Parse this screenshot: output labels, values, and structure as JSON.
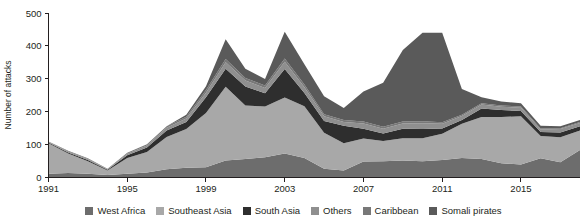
{
  "chart_data": {
    "type": "area",
    "stacked": true,
    "title": "",
    "xlabel": "",
    "ylabel": "Number of attacks",
    "ylim": [
      0,
      500
    ],
    "ytick_step": 100,
    "yticks": [
      0,
      100,
      200,
      300,
      400,
      500
    ],
    "ytick_labels": [
      "0",
      "100",
      "200",
      "300",
      "400",
      "500"
    ],
    "xlim": [
      1991,
      2018
    ],
    "xticks": [
      1991,
      1995,
      1999,
      2003,
      2007,
      2011,
      2015
    ],
    "xtick_labels": [
      "1991",
      "1995",
      "1999",
      "2003",
      "2007",
      "2011",
      "2015"
    ],
    "grid": false,
    "legend_position": "bottom",
    "x": [
      1991,
      1992,
      1993,
      1994,
      1995,
      1996,
      1997,
      1998,
      1999,
      2000,
      2001,
      2002,
      2003,
      2004,
      2005,
      2006,
      2007,
      2008,
      2009,
      2010,
      2011,
      2012,
      2013,
      2014,
      2015,
      2016,
      2017,
      2018
    ],
    "series": [
      {
        "name": "West Africa",
        "color": "#6d6d6d",
        "values": [
          10,
          12,
          10,
          6,
          10,
          14,
          24,
          28,
          30,
          50,
          55,
          60,
          72,
          58,
          25,
          20,
          47,
          48,
          50,
          48,
          52,
          58,
          55,
          42,
          38,
          57,
          45,
          82
        ]
      },
      {
        "name": "Southeast Asia",
        "color": "#a8a8a8",
        "values": [
          93,
          60,
          38,
          14,
          48,
          62,
          98,
          118,
          165,
          225,
          163,
          155,
          170,
          158,
          110,
          83,
          70,
          62,
          68,
          70,
          80,
          104,
          128,
          141,
          147,
          68,
          76,
          60
        ]
      },
      {
        "name": "South Asia",
        "color": "#2e2e2e",
        "values": [
          2,
          3,
          4,
          2,
          8,
          14,
          20,
          22,
          48,
          55,
          58,
          40,
          87,
          40,
          36,
          53,
          30,
          23,
          29,
          28,
          16,
          12,
          26,
          21,
          16,
          12,
          15,
          13
        ]
      },
      {
        "name": "Others",
        "color": "#8f8f8f",
        "values": [
          2,
          3,
          3,
          2,
          5,
          6,
          8,
          10,
          14,
          20,
          18,
          16,
          22,
          18,
          14,
          12,
          16,
          14,
          16,
          18,
          14,
          12,
          12,
          10,
          10,
          8,
          10,
          10
        ]
      },
      {
        "name": "Caribbean",
        "color": "#787878",
        "values": [
          1,
          2,
          2,
          1,
          3,
          4,
          5,
          6,
          8,
          10,
          8,
          8,
          10,
          8,
          6,
          6,
          6,
          6,
          6,
          6,
          5,
          4,
          4,
          4,
          4,
          3,
          3,
          3
        ]
      },
      {
        "name": "Somali pirates",
        "color": "#5a5a5a",
        "values": [
          0,
          0,
          0,
          0,
          0,
          0,
          0,
          6,
          12,
          60,
          28,
          20,
          82,
          62,
          55,
          36,
          92,
          134,
          218,
          270,
          273,
          78,
          18,
          12,
          10,
          8,
          6,
          6
        ]
      }
    ]
  },
  "legend": {
    "items": [
      {
        "label": "West Africa",
        "color": "#6d6d6d"
      },
      {
        "label": "Southeast Asia",
        "color": "#a8a8a8"
      },
      {
        "label": "South Asia",
        "color": "#2e2e2e"
      },
      {
        "label": "Others",
        "color": "#8f8f8f"
      },
      {
        "label": "Caribbean",
        "color": "#787878"
      },
      {
        "label": "Somali pirates",
        "color": "#5a5a5a"
      }
    ]
  }
}
